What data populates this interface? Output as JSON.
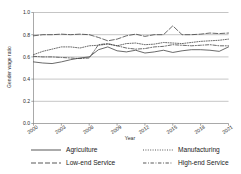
{
  "chart_data": {
    "type": "line",
    "title": "",
    "xlabel": "Year",
    "ylabel": "Gender wage ratio",
    "xlim": [
      2000,
      2021
    ],
    "ylim": [
      0.0,
      1.0
    ],
    "grid": true,
    "grid_axis": "y",
    "legend_position": "bottom",
    "legend_columns": 2,
    "x": [
      2000,
      2001,
      2002,
      2003,
      2004,
      2005,
      2006,
      2007,
      2008,
      2009,
      2010,
      2011,
      2012,
      2013,
      2014,
      2015,
      2016,
      2017,
      2018,
      2019,
      2020,
      2021
    ],
    "xticks": [
      2000,
      2003,
      2006,
      2009,
      2012,
      2015,
      2018,
      2021
    ],
    "xtick_labels": [
      "2000",
      "2003",
      "2006",
      "2009",
      "2012",
      "2015",
      "2018",
      "2021"
    ],
    "yticks": [
      0.0,
      0.2,
      0.4,
      0.6,
      0.8,
      1.0
    ],
    "ytick_labels": [
      "0.0",
      "0.2",
      "0.4",
      "0.6",
      "0.8",
      "1.0"
    ],
    "series": [
      {
        "name": "Agriculture",
        "style": "solid",
        "dash": "none",
        "color": "#3a3a3a",
        "values": [
          0.555,
          0.545,
          0.54,
          0.555,
          0.575,
          0.59,
          0.6,
          0.665,
          0.69,
          0.655,
          0.645,
          0.66,
          0.635,
          0.645,
          0.66,
          0.64,
          0.655,
          0.665,
          0.665,
          0.66,
          0.65,
          0.69
        ]
      },
      {
        "name": "Manufacturing",
        "style": "dotted",
        "dash": "1,1.4",
        "color": "#3a3a3a",
        "values": [
          0.62,
          0.65,
          0.67,
          0.69,
          0.69,
          0.68,
          0.7,
          0.705,
          0.715,
          0.7,
          0.72,
          0.725,
          0.71,
          0.715,
          0.73,
          0.725,
          0.72,
          0.73,
          0.74,
          0.745,
          0.75,
          0.76
        ]
      },
      {
        "name": "Low-end Service",
        "style": "long-dash",
        "dash": "5,2",
        "color": "#3a3a3a",
        "values": [
          0.79,
          0.8,
          0.8,
          0.805,
          0.8,
          0.805,
          0.8,
          0.775,
          0.745,
          0.76,
          0.79,
          0.805,
          0.785,
          0.8,
          0.8,
          0.88,
          0.8,
          0.8,
          0.805,
          0.815,
          0.81,
          0.815
        ]
      },
      {
        "name": "High-end Service",
        "style": "dash-dot",
        "dash": "3.4,1.6,0.9,1.6",
        "color": "#3a3a3a",
        "values": [
          0.605,
          0.6,
          0.6,
          0.595,
          0.59,
          0.585,
          0.59,
          0.71,
          0.72,
          0.7,
          0.68,
          0.67,
          0.675,
          0.69,
          0.695,
          0.71,
          0.705,
          0.7,
          0.705,
          0.71,
          0.7,
          0.7
        ]
      }
    ]
  },
  "legend": {
    "entries": [
      {
        "label": "Agriculture"
      },
      {
        "label": "Manufacturing"
      },
      {
        "label": "Low-end Service"
      },
      {
        "label": "High-end Service"
      }
    ]
  }
}
